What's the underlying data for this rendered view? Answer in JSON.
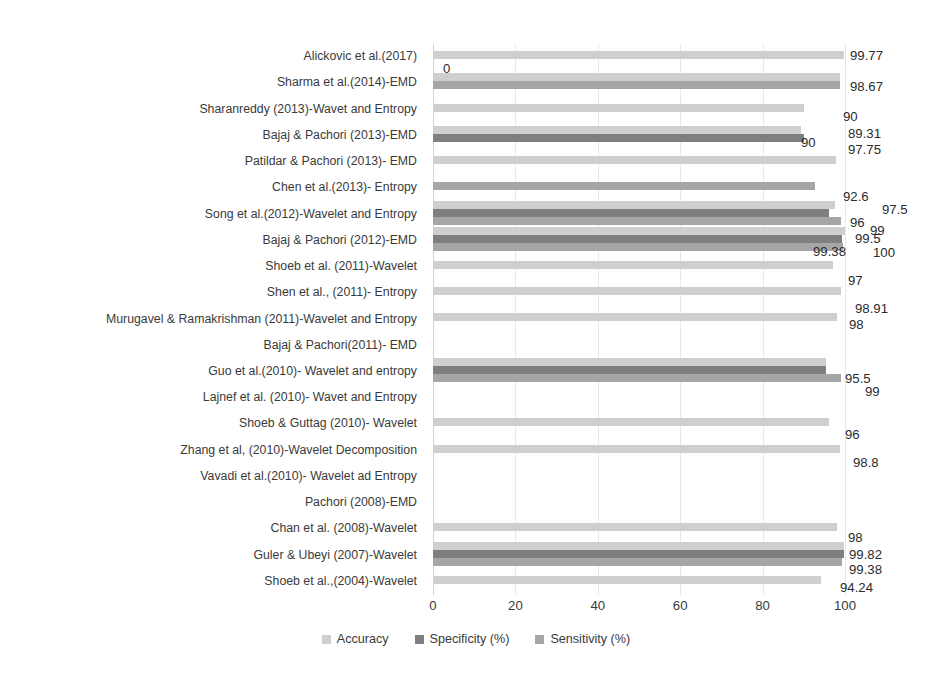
{
  "chart_data": {
    "type": "bar",
    "orientation": "horizontal",
    "title": "",
    "xlabel": "",
    "ylabel": "",
    "xlim": [
      0,
      100
    ],
    "xticks": [
      0,
      20,
      40,
      60,
      80,
      100
    ],
    "grid": true,
    "legend_position": "bottom",
    "categories": [
      "Alickovic et al.(2017)",
      "Sharma et al.(2014)-EMD",
      "Sharanreddy (2013)-Wavet and Entropy",
      "Bajaj & Pachori (2013)-EMD",
      "Patildar & Pachori (2013)- EMD",
      "Chen et al.(2013)- Entropy",
      "Song et al.(2012)-Wavelet and Entropy",
      "Bajaj & Pachori (2012)-EMD",
      "Shoeb et al. (2011)-Wavelet",
      "Shen et al., (2011)- Entropy",
      "Murugavel & Ramakrishman (2011)-Wavelet and Entropy",
      "Bajaj & Pachori(2011)- EMD",
      "Guo et al.(2010)- Wavelet and entropy",
      "Lajnef et al. (2010)- Wavet and Entropy",
      "Shoeb & Guttag (2010)- Wavelet",
      "Zhang et al, (2010)-Wavelet Decomposition",
      "Vavadi et al.(2010)- Wavelet ad Entropy",
      "Pachori (2008)-EMD",
      "Chan et al. (2008)-Wavelet",
      "Guler & Ubeyi (2007)-Wavelet",
      "Shoeb et al.,(2004)-Wavelet"
    ],
    "series": [
      {
        "name": "Accuracy",
        "color": "#cfcfcf",
        "values": [
          99.77,
          98.67,
          90,
          89.31,
          97.75,
          null,
          97.5,
          100,
          97,
          98.91,
          98,
          null,
          95.5,
          null,
          96,
          98.8,
          null,
          null,
          98,
          99.82,
          94.24
        ]
      },
      {
        "name": "Specificity (%)",
        "color": "#7f7f7f",
        "values": [
          null,
          null,
          null,
          90,
          null,
          null,
          96,
          99.38,
          null,
          null,
          null,
          null,
          95.5,
          null,
          null,
          null,
          null,
          null,
          null,
          99.82,
          null
        ]
      },
      {
        "name": "Sensitivity (%)",
        "color": "#a6a6a6",
        "values": [
          null,
          98.67,
          null,
          null,
          null,
          92.6,
          99,
          99.5,
          null,
          null,
          null,
          null,
          99,
          null,
          null,
          null,
          null,
          null,
          null,
          99.38,
          null
        ]
      }
    ],
    "value_labels": [
      {
        "text": "99.77",
        "x": 850,
        "y": 49
      },
      {
        "text": "0",
        "x": 443,
        "y": 62
      },
      {
        "text": "98.67",
        "x": 850,
        "y": 80
      },
      {
        "text": "90",
        "x": 843,
        "y": 110
      },
      {
        "text": "90",
        "x": 801,
        "y": 136
      },
      {
        "text": "89.31",
        "x": 848,
        "y": 127
      },
      {
        "text": "97.75",
        "x": 848,
        "y": 143
      },
      {
        "text": "92.6",
        "x": 843,
        "y": 190
      },
      {
        "text": "97.5",
        "x": 882,
        "y": 203
      },
      {
        "text": "96",
        "x": 850,
        "y": 216
      },
      {
        "text": "99",
        "x": 870,
        "y": 224
      },
      {
        "text": "99.5",
        "x": 855,
        "y": 232
      },
      {
        "text": "99.38",
        "x": 813,
        "y": 245
      },
      {
        "text": "100",
        "x": 873,
        "y": 246
      },
      {
        "text": "97",
        "x": 848,
        "y": 274
      },
      {
        "text": "98.91",
        "x": 855,
        "y": 302
      },
      {
        "text": "98",
        "x": 849,
        "y": 318
      },
      {
        "text": "95.5",
        "x": 845,
        "y": 372
      },
      {
        "text": "99",
        "x": 865,
        "y": 385
      },
      {
        "text": "96",
        "x": 845,
        "y": 428
      },
      {
        "text": "98.8",
        "x": 853,
        "y": 456
      },
      {
        "text": "98",
        "x": 848,
        "y": 531
      },
      {
        "text": "99.82",
        "x": 849,
        "y": 548
      },
      {
        "text": "99.38",
        "x": 849,
        "y": 563
      },
      {
        "text": "94.24",
        "x": 840,
        "y": 581
      }
    ]
  },
  "legend": {
    "items": [
      {
        "label": "Accuracy",
        "color": "#cfcfcf"
      },
      {
        "label": "Specificity (%)",
        "color": "#7f7f7f"
      },
      {
        "label": "Sensitivity (%)",
        "color": "#a6a6a6"
      }
    ]
  }
}
